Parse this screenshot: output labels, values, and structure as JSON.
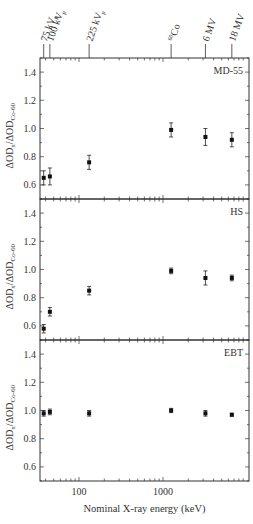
{
  "chart_data": {
    "type": "scatter",
    "title": "",
    "xlabel": "Nominal X-ray energy (keV)",
    "ylabel": "ΔOD_x/ΔOD_Co-60",
    "xscale": "log",
    "xlim": [
      33,
      9000
    ],
    "ylim": [
      0.5,
      1.5
    ],
    "x_ticks": [
      100,
      1000
    ],
    "x_tick_labels": [
      "100",
      "1000"
    ],
    "y_ticks": [
      0.6,
      0.8,
      1.0,
      1.2,
      1.4
    ],
    "y_tick_labels": [
      "0.6",
      "0.8",
      "1.0",
      "1.2",
      "1.4"
    ],
    "top_annotations": [
      {
        "label": "75 kVp",
        "x": 38
      },
      {
        "label": "100 kVp",
        "x": 45
      },
      {
        "label": "225 kVp",
        "x": 132
      },
      {
        "label": "60Co",
        "x": 1250
      },
      {
        "label": "6 MV",
        "x": 3200
      },
      {
        "label": "18 MV",
        "x": 6600
      }
    ],
    "x": [
      38,
      45,
      132,
      1250,
      3200,
      6600
    ],
    "panels": [
      {
        "name": "MD-55",
        "values": [
          0.65,
          0.66,
          0.76,
          0.99,
          0.94,
          0.92
        ],
        "errors": [
          0.05,
          0.06,
          0.05,
          0.05,
          0.06,
          0.05
        ]
      },
      {
        "name": "HS",
        "values": [
          0.58,
          0.7,
          0.85,
          0.99,
          0.94,
          0.94
        ],
        "errors": [
          0.03,
          0.03,
          0.03,
          0.02,
          0.05,
          0.02
        ]
      },
      {
        "name": "EBT",
        "values": [
          0.98,
          0.99,
          0.98,
          1.0,
          0.98,
          0.97
        ],
        "errors": [
          0.02,
          0.02,
          0.02,
          0.015,
          0.02,
          0.01
        ]
      }
    ],
    "grid": false,
    "legend": "panel labels top-right"
  },
  "labels": {
    "xlabel": "Nominal X-ray energy (keV)",
    "ylabel_main": "ΔOD",
    "ylabel_sub1": "x",
    "ylabel_mid": "/ΔOD",
    "ylabel_sub2": "Co-60"
  }
}
